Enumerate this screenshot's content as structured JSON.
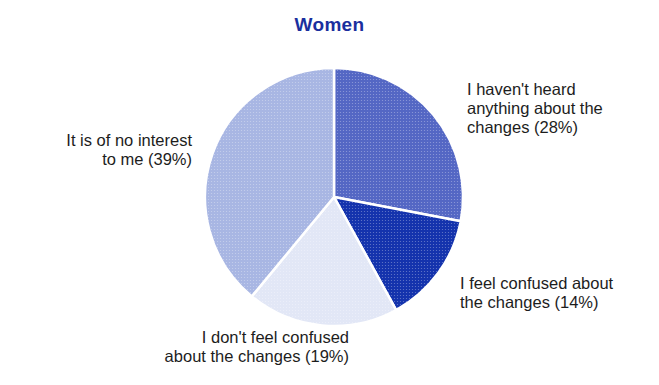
{
  "chart_data": {
    "type": "pie",
    "title": "Women",
    "start_angle_deg": 0,
    "direction": "clockwise",
    "slices": [
      {
        "label": "I haven't heard anything about the changes (28%)",
        "value": 28,
        "color": "#5467c4"
      },
      {
        "label": "I feel confused about the changes (14%)",
        "value": 14,
        "color": "#1433ad"
      },
      {
        "label": "I don't feel confused about the changes (19%)",
        "value": 19,
        "color": "#e2e7f6"
      },
      {
        "label": "It is of no interest to me (39%)",
        "value": 39,
        "color": "#a8b6e3"
      }
    ],
    "center": [
      334,
      197
    ],
    "radius": 129,
    "legend": "none (direct labels)"
  },
  "labels": {
    "slice_0": "I haven't heard\nanything about the\nchanges (28%)",
    "slice_1": "I feel confused about\nthe changes (14%)",
    "slice_2": "I don't feel confused\nabout the changes (19%)",
    "slice_3": "It is of no interest\nto me (39%)"
  }
}
